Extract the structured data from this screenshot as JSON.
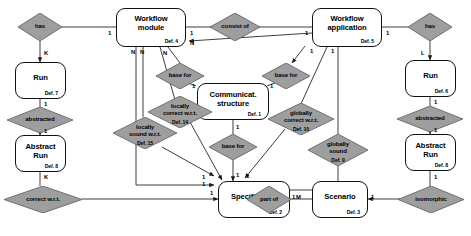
{
  "diagram": {
    "entities": [
      {
        "id": "wf_module",
        "name1": "Workflow",
        "name2": "module",
        "def": "Def. 4"
      },
      {
        "id": "wf_app",
        "name1": "Workflow",
        "name2": "application",
        "def": "Def. 5"
      },
      {
        "id": "run_left",
        "name1": "Run",
        "name2": "",
        "def": "Def. 7"
      },
      {
        "id": "run_right",
        "name1": "Run",
        "name2": "",
        "def": "Def. 6"
      },
      {
        "id": "abs_left",
        "name1": "Abstract",
        "name2": "Run",
        "def": "Def. 8"
      },
      {
        "id": "abs_right",
        "name1": "Abstract",
        "name2": "Run",
        "def": "Def. 8"
      },
      {
        "id": "comm",
        "name1": "Communicat.",
        "name2": "structure",
        "def": "Def. 1"
      },
      {
        "id": "spec",
        "name1": "Specification",
        "name2": "",
        "def": "Def. 2"
      },
      {
        "id": "scenario",
        "name1": "Scenario",
        "name2": "",
        "def": "Def. 3"
      }
    ],
    "relationships": [
      {
        "id": "has_left",
        "l1": "has",
        "l2": "",
        "def": ""
      },
      {
        "id": "has_right",
        "l1": "has",
        "l2": "",
        "def": ""
      },
      {
        "id": "consist_of",
        "l1": "consist of",
        "l2": "",
        "def": ""
      },
      {
        "id": "abstracted_l",
        "l1": "abstracted",
        "l2": "",
        "def": ""
      },
      {
        "id": "abstracted_r",
        "l1": "abstracted",
        "l2": "",
        "def": ""
      },
      {
        "id": "base_for_l",
        "l1": "base for",
        "l2": "",
        "def": ""
      },
      {
        "id": "base_for_r",
        "l1": "base for",
        "l2": "",
        "def": ""
      },
      {
        "id": "base_for_b",
        "l1": "base for",
        "l2": "",
        "def": ""
      },
      {
        "id": "loc_correct",
        "l1": "locally",
        "l2": "correct w.r.t.",
        "def": "Def. 14"
      },
      {
        "id": "loc_sound",
        "l1": "locally",
        "l2": "sound w.r.t.",
        "def": "Def. 15"
      },
      {
        "id": "glob_correct",
        "l1": "globally",
        "l2": "correct w.r.t.",
        "def": "Def. 10"
      },
      {
        "id": "glob_sound",
        "l1": "globally",
        "l2": "sound",
        "def": "Def. 9"
      },
      {
        "id": "correct_wrt",
        "l1": "correct w.r.t.",
        "l2": "",
        "def": ""
      },
      {
        "id": "part_of",
        "l1": "part of",
        "l2": "",
        "def": ""
      },
      {
        "id": "isomorphic",
        "l1": "isomorphic",
        "l2": "",
        "def": ""
      }
    ],
    "cardinalities": [
      {
        "id": "c1",
        "value": "1"
      },
      {
        "id": "c2",
        "value": "K"
      },
      {
        "id": "c3",
        "value": "1"
      },
      {
        "id": "c4",
        "value": "1"
      },
      {
        "id": "c5",
        "value": "K"
      },
      {
        "id": "c6",
        "value": "1"
      },
      {
        "id": "c7",
        "value": "N"
      },
      {
        "id": "c8",
        "value": "N"
      },
      {
        "id": "c9",
        "value": "N"
      },
      {
        "id": "c10",
        "value": "N"
      },
      {
        "id": "c11",
        "value": "1"
      },
      {
        "id": "c12",
        "value": "1"
      },
      {
        "id": "c13",
        "value": "1"
      },
      {
        "id": "c14",
        "value": "1"
      },
      {
        "id": "c15",
        "value": "1"
      },
      {
        "id": "c16",
        "value": "1"
      },
      {
        "id": "c17",
        "value": "1"
      },
      {
        "id": "c18",
        "value": "1"
      },
      {
        "id": "c19",
        "value": "1"
      },
      {
        "id": "c20",
        "value": "1"
      },
      {
        "id": "c21",
        "value": "1"
      },
      {
        "id": "c22",
        "value": "1"
      },
      {
        "id": "c23",
        "value": "1"
      },
      {
        "id": "c24",
        "value": "M"
      },
      {
        "id": "c25",
        "value": "1"
      },
      {
        "id": "c26",
        "value": "1"
      },
      {
        "id": "c27",
        "value": "L"
      },
      {
        "id": "c28",
        "value": "1"
      },
      {
        "id": "c29",
        "value": "1"
      }
    ],
    "colors": {
      "diamond_fill": "#9e9e9e",
      "diamond_stroke": "#5a5a5a",
      "entity_stroke": "#111111",
      "edge": "#1a1a1a",
      "background": "#ffffff"
    }
  }
}
